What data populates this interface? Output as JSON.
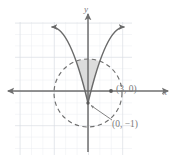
{
  "figure": {
    "kind": "coordinate-plane-graph",
    "axes": {
      "x_axis_label": "x",
      "y_axis_label": "y",
      "x_axis_label_icon": "italic-x-glyph",
      "y_axis_label_icon": "italic-y-glyph",
      "origin_px": {
        "x": 88,
        "y": 91
      },
      "grid_spacing_px": 11.4,
      "grid_color": "#d9dde2",
      "grid_minor_color": "#eceef1",
      "axis_color": "#6f6f6f",
      "grid_bounds_px": {
        "left": 15,
        "top": 22,
        "right": 132,
        "bottom": 155
      }
    },
    "labels": [
      {
        "name": "point-label-3-0",
        "text": "(3, 0)",
        "marks_point": {
          "x": 3,
          "y": 0
        },
        "text_px": {
          "x": 116,
          "y": 92
        },
        "color": "#7b7b7b"
      },
      {
        "name": "point-label-0-neg1",
        "text": "(0, −1)",
        "marks_point": {
          "x": 0,
          "y": -1
        },
        "text_px": {
          "x": 112,
          "y": 124
        },
        "color": "#7b7b7b"
      }
    ],
    "curves": [
      {
        "name": "parabola",
        "style": "solid",
        "stroke": "#6a6a6a",
        "arrowheads": "both-ends-upward",
        "vertex": {
          "x": 0,
          "y": -1
        },
        "description": "upward opening parabola with vertex at (0, -1)"
      },
      {
        "name": "circle",
        "style": "dashed",
        "stroke": "#6f6f6f",
        "center": {
          "x": 0,
          "y": 0.2
        },
        "radius": 3,
        "center_px": {
          "x": 88,
          "y": 93
        },
        "radius_px": 34,
        "description": "dashed circle of radius 3 centered near the origin"
      }
    ],
    "shaded_region": {
      "name": "region-between-parabola-and-circle",
      "fill": "#d2d2d2",
      "opacity": 0.75,
      "description": "region inside the circle and above the parabola"
    },
    "pointers": [
      {
        "name": "leader-line-to-vertex",
        "from_px": {
          "x": 110,
          "y": 121
        },
        "to_px": {
          "x": 90,
          "y": 106
        },
        "style": "solid-arrow",
        "stroke": "#7b7b7b"
      }
    ],
    "markers": [
      {
        "name": "dot-3-0",
        "at_px": {
          "x": 111,
          "y": 91
        },
        "fill": "#5a5a5a",
        "radius_px": 1.9
      },
      {
        "name": "dot-0-neg1",
        "at_px": {
          "x": 88,
          "y": 103
        },
        "fill": "#5a5a5a",
        "radius_px": 1.7
      }
    ]
  }
}
